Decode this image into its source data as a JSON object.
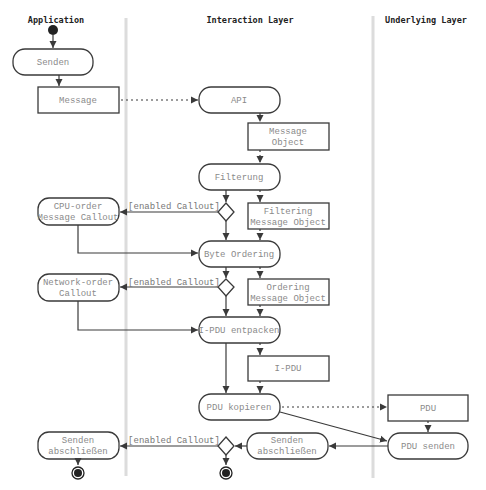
{
  "lanes": [
    {
      "title": "Application"
    },
    {
      "title": "Interaction Layer"
    },
    {
      "title": "Underlying Layer"
    }
  ],
  "nodes": {
    "senden": {
      "label": [
        "Senden"
      ]
    },
    "message": {
      "label": [
        "Message"
      ]
    },
    "api": {
      "label": [
        "API"
      ]
    },
    "message_object": {
      "label": [
        "Message",
        "Object"
      ]
    },
    "filterung": {
      "label": [
        "Filterung"
      ]
    },
    "cpu_callout": {
      "label": [
        "CPU-order",
        "Message Callout"
      ]
    },
    "filtering_mo": {
      "label": [
        "Filtering",
        "Message Object"
      ]
    },
    "byte_ordering": {
      "label": [
        "Byte Ordering"
      ]
    },
    "network_callout": {
      "label": [
        "Network-order",
        "Callout"
      ]
    },
    "ordering_mo": {
      "label": [
        "Ordering",
        "Message Object"
      ]
    },
    "ipdu_entpacken": {
      "label": [
        "I-PDU entpacken"
      ]
    },
    "ipdu": {
      "label": [
        "I-PDU"
      ]
    },
    "pdu_kopieren": {
      "label": [
        "PDU kopieren"
      ]
    },
    "pdu": {
      "label": [
        "PDU"
      ]
    },
    "pdu_senden": {
      "label": [
        "PDU senden"
      ]
    },
    "senden_abschliessen_mid": {
      "label": [
        "Senden",
        "abschließen"
      ]
    },
    "senden_abschliessen_left": {
      "label": [
        "Senden",
        "abschließen"
      ]
    }
  },
  "guards": {
    "g1": "[enabled Callout]",
    "g2": "[enabled Callout]",
    "g3": "[enabled Callout]"
  },
  "colors": {
    "stroke": "#3a3a3a",
    "node_text": "#8a8a8a",
    "divider": "#dcdcdc"
  }
}
